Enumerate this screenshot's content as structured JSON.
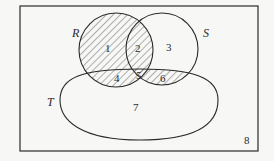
{
  "diagram": {
    "type": "venn",
    "universe": {
      "label": "8",
      "rect": {
        "x": 20,
        "y": 6,
        "width": 238,
        "height": 145
      }
    },
    "sets": [
      {
        "name": "R",
        "shape": "circle",
        "cx": 116,
        "cy": 50,
        "r": 37,
        "label_x": 76,
        "label_y": 37
      },
      {
        "name": "S",
        "shape": "circle",
        "cx": 162,
        "cy": 49,
        "r": 36,
        "label_x": 206,
        "label_y": 37
      },
      {
        "name": "T",
        "shape": "oval",
        "label_x": 51,
        "label_y": 106
      }
    ],
    "regions": [
      {
        "id": "1",
        "x": 108,
        "y": 52,
        "shaded": true
      },
      {
        "id": "2",
        "x": 138,
        "y": 52,
        "shaded": true
      },
      {
        "id": "3",
        "x": 169,
        "y": 51,
        "shaded": false
      },
      {
        "id": "4",
        "x": 117,
        "y": 82,
        "shaded": true
      },
      {
        "id": "5",
        "x": 139,
        "y": 79,
        "shaded": true
      },
      {
        "id": "6",
        "x": 163,
        "y": 82,
        "shaded": true
      },
      {
        "id": "7",
        "x": 136,
        "y": 111,
        "shaded": false
      },
      {
        "id": "8",
        "x": 247,
        "y": 144,
        "shaded": false
      }
    ],
    "shaded_description": "R ∪ (S ∩ T)",
    "colors": {
      "stroke": "#2a2a2a",
      "hatch": "#555555",
      "background": "#f7f7f5"
    }
  }
}
